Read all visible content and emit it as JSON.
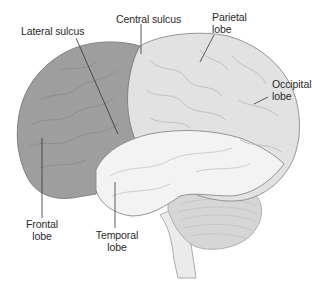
{
  "diagram": {
    "colors": {
      "frontal_lobe": "#9e9e9e",
      "parietal_occipital": "#e2e2e2",
      "temporal_lobe": "#f3f3f3",
      "cerebellum": "#d6d6d6",
      "brainstem": "#ebebeb",
      "outline": "#8a8a8a",
      "leader_line": "#333333",
      "label_text": "#2a2a2a"
    },
    "labels": [
      {
        "id": "lateral-sulcus",
        "line1": "Lateral sulcus",
        "line2": ""
      },
      {
        "id": "central-sulcus",
        "line1": "Central sulcus",
        "line2": ""
      },
      {
        "id": "parietal-lobe",
        "line1": "Parietal",
        "line2": "lobe"
      },
      {
        "id": "occipital-lobe",
        "line1": "Occipital",
        "line2": "lobe"
      },
      {
        "id": "frontal-lobe",
        "line1": "Frontal",
        "line2": "lobe"
      },
      {
        "id": "temporal-lobe",
        "line1": "Temporal",
        "line2": "lobe"
      }
    ]
  }
}
